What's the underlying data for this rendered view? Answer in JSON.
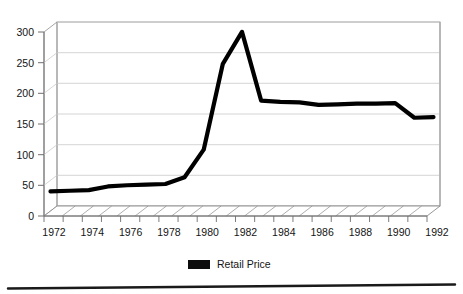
{
  "chart_data": {
    "type": "line",
    "title": "",
    "subtitle": "",
    "xlabel": "",
    "ylabel": "",
    "xlim": [
      1972,
      1992
    ],
    "ylim": [
      0,
      300
    ],
    "yticks": [
      0,
      50,
      100,
      150,
      200,
      250,
      300
    ],
    "xticks": [
      1972,
      1973,
      1974,
      1975,
      1976,
      1977,
      1978,
      1979,
      1980,
      1981,
      1982,
      1983,
      1984,
      1985,
      1986,
      1987,
      1988,
      1989,
      1990,
      1991,
      1992
    ],
    "xtick_labels": [
      "1972",
      "",
      "1974",
      "",
      "1976",
      "",
      "1978",
      "",
      "1980",
      "",
      "1982",
      "",
      "1984",
      "",
      "1986",
      "",
      "1988",
      "",
      "1990",
      "",
      "1992"
    ],
    "ytick_labels": [
      "0",
      "50",
      "100",
      "150",
      "200",
      "250",
      "300"
    ],
    "grid": true,
    "grid_axis": "y",
    "legend_position": "bottom-center",
    "style": "3d-perspective-scan",
    "x": [
      1972,
      1973,
      1974,
      1975,
      1976,
      1977,
      1978,
      1979,
      1980,
      1981,
      1982,
      1983,
      1984,
      1985,
      1986,
      1987,
      1988,
      1989,
      1990,
      1991,
      1992
    ],
    "series": [
      {
        "name": "Retail Price",
        "color": "#000000",
        "values": [
          32,
          33,
          34,
          40,
          42,
          43,
          44,
          55,
          100,
          240,
          292,
          180,
          178,
          177,
          173,
          174,
          175,
          175,
          176,
          152,
          153
        ]
      }
    ]
  },
  "axes": {
    "y": {
      "ticks": [
        "300",
        "250",
        "200",
        "150",
        "100",
        "50",
        "0"
      ]
    },
    "x": {
      "labels": [
        "1972",
        "1974",
        "1976",
        "1978",
        "1980",
        "1982",
        "1984",
        "1986",
        "1988",
        "1990",
        "1992"
      ]
    }
  },
  "legend": {
    "entries": [
      {
        "label": "Retail Price",
        "color": "#0d0d0d"
      }
    ]
  },
  "colors": {
    "line": "#0a0a0a",
    "grid": "#c9c9c9",
    "frame": "#8c8c8c",
    "text": "#141414",
    "rule": "#1a1a1a"
  }
}
